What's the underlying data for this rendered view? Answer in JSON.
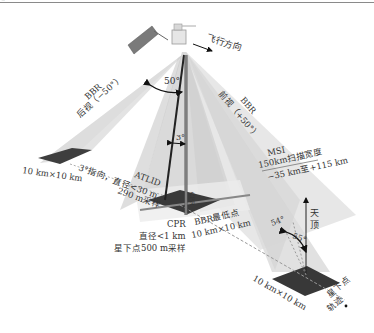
{
  "figure": {
    "flight_direction": "飞行方向",
    "bbr_back": {
      "name": "BBR",
      "view": "后视（−50°）"
    },
    "bbr_fore": {
      "name": "BBR",
      "view": "前视（+50°）"
    },
    "angle_50": "50°",
    "angle_3": "3°",
    "atlid": {
      "name": "ATLID",
      "line1": "3°指向，直径<30 m",
      "line2": "290 m采样"
    },
    "cpr": {
      "name": "CPR",
      "line1": "直径<1 km",
      "line2": "星下点500 m采样",
      "bar_text": "CPR"
    },
    "bbr_nadir": {
      "line1": "BBR最低点",
      "line2": "10 km×10 km"
    },
    "msi": {
      "name": "MSI",
      "line1": "150km扫描宽度",
      "line2": "−35 km至+115 km"
    },
    "footprint_back": "10 km×10 km",
    "footprint_sun": "10 km×10 km",
    "zenith": "天顶",
    "angle_54": "54°",
    "angle_55": "55°",
    "ground_track": "星下点轨迹"
  },
  "colors": {
    "beam_light": "#e6e6e6",
    "beam_mid": "#d2d2d2",
    "footprint": "#3e3e3e",
    "solar_panel": "#7a7a7a",
    "text": "#333333"
  }
}
